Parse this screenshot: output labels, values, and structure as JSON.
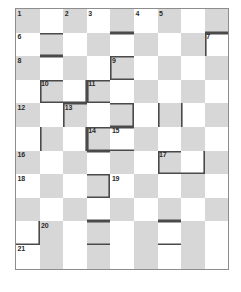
{
  "puzzle": {
    "kind": "crossword-grid",
    "columns": 9,
    "rows": 11,
    "colors": {
      "shaded_cell": "#d7d7d7",
      "empty_cell": "#ffffff",
      "grid_border": "#8d8d8d",
      "accent_border": "#4a4a4a",
      "number_text": "#2b2b2b"
    },
    "clue_numbers": [
      {
        "n": "1",
        "row": 1,
        "col": 1
      },
      {
        "n": "2",
        "row": 1,
        "col": 3
      },
      {
        "n": "3",
        "row": 1,
        "col": 4
      },
      {
        "n": "4",
        "row": 1,
        "col": 6
      },
      {
        "n": "5",
        "row": 1,
        "col": 7
      },
      {
        "n": "6",
        "row": 2,
        "col": 1
      },
      {
        "n": "7",
        "row": 2,
        "col": 9
      },
      {
        "n": "8",
        "row": 3,
        "col": 1
      },
      {
        "n": "9",
        "row": 3,
        "col": 5
      },
      {
        "n": "10",
        "row": 4,
        "col": 2
      },
      {
        "n": "11",
        "row": 4,
        "col": 4
      },
      {
        "n": "12",
        "row": 5,
        "col": 1
      },
      {
        "n": "13",
        "row": 5,
        "col": 3
      },
      {
        "n": "14",
        "row": 6,
        "col": 4
      },
      {
        "n": "15",
        "row": 6,
        "col": 5
      },
      {
        "n": "16",
        "row": 7,
        "col": 1
      },
      {
        "n": "17",
        "row": 7,
        "col": 7
      },
      {
        "n": "18",
        "row": 8,
        "col": 1
      },
      {
        "n": "19",
        "row": 8,
        "col": 5
      },
      {
        "n": "20",
        "row": 10,
        "col": 2
      },
      {
        "n": "21",
        "row": 11,
        "col": 1
      }
    ],
    "cells": [
      [
        {
          "shaded": true,
          "num": "1",
          "edges": []
        },
        {
          "shaded": false,
          "num": "",
          "edges": []
        },
        {
          "shaded": true,
          "num": "2",
          "edges": []
        },
        {
          "shaded": false,
          "num": "3",
          "edges": []
        },
        {
          "shaded": true,
          "num": "",
          "edges": [
            "bb"
          ]
        },
        {
          "shaded": false,
          "num": "4",
          "edges": []
        },
        {
          "shaded": true,
          "num": "5",
          "edges": []
        },
        {
          "shaded": false,
          "num": "",
          "edges": []
        },
        {
          "shaded": true,
          "num": "",
          "edges": [
            "bb"
          ]
        }
      ],
      [
        {
          "shaded": false,
          "num": "6",
          "edges": []
        },
        {
          "shaded": true,
          "num": "",
          "edges": [
            "bt",
            "bb"
          ]
        },
        {
          "shaded": false,
          "num": "",
          "edges": []
        },
        {
          "shaded": true,
          "num": "",
          "edges": []
        },
        {
          "shaded": false,
          "num": "",
          "edges": [
            "bt"
          ]
        },
        {
          "shaded": true,
          "num": "",
          "edges": []
        },
        {
          "shaded": false,
          "num": "",
          "edges": []
        },
        {
          "shaded": true,
          "num": "",
          "edges": []
        },
        {
          "shaded": false,
          "num": "7",
          "edges": [
            "bt",
            "bl"
          ]
        }
      ],
      [
        {
          "shaded": true,
          "num": "8",
          "edges": []
        },
        {
          "shaded": false,
          "num": "",
          "edges": [
            "bt"
          ]
        },
        {
          "shaded": true,
          "num": "",
          "edges": []
        },
        {
          "shaded": false,
          "num": "",
          "edges": []
        },
        {
          "shaded": true,
          "num": "9",
          "edges": [
            "bt",
            "bl",
            "bb"
          ]
        },
        {
          "shaded": false,
          "num": "",
          "edges": []
        },
        {
          "shaded": true,
          "num": "",
          "edges": []
        },
        {
          "shaded": false,
          "num": "",
          "edges": []
        },
        {
          "shaded": true,
          "num": "",
          "edges": []
        }
      ],
      [
        {
          "shaded": false,
          "num": "",
          "edges": []
        },
        {
          "shaded": true,
          "num": "10",
          "edges": [
            "bt",
            "bl",
            "bb"
          ]
        },
        {
          "shaded": false,
          "num": "",
          "edges": [
            "bb",
            "br"
          ]
        },
        {
          "shaded": true,
          "num": "11",
          "edges": [
            "bt",
            "bl",
            "bb"
          ]
        },
        {
          "shaded": false,
          "num": "",
          "edges": []
        },
        {
          "shaded": true,
          "num": "",
          "edges": []
        },
        {
          "shaded": false,
          "num": "",
          "edges": []
        },
        {
          "shaded": true,
          "num": "",
          "edges": []
        },
        {
          "shaded": false,
          "num": "",
          "edges": []
        }
      ],
      [
        {
          "shaded": true,
          "num": "12",
          "edges": []
        },
        {
          "shaded": false,
          "num": "",
          "edges": []
        },
        {
          "shaded": true,
          "num": "13",
          "edges": [
            "bt",
            "bl"
          ]
        },
        {
          "shaded": false,
          "num": "",
          "edges": []
        },
        {
          "shaded": true,
          "num": "",
          "edges": [
            "bt",
            "bb",
            "br"
          ]
        },
        {
          "shaded": false,
          "num": "",
          "edges": []
        },
        {
          "shaded": true,
          "num": "",
          "edges": [
            "bl"
          ]
        },
        {
          "shaded": false,
          "num": "",
          "edges": [
            "bl"
          ]
        },
        {
          "shaded": true,
          "num": "",
          "edges": []
        }
      ],
      [
        {
          "shaded": false,
          "num": "",
          "edges": []
        },
        {
          "shaded": true,
          "num": "",
          "edges": [
            "bl"
          ]
        },
        {
          "shaded": false,
          "num": "",
          "edges": [
            "br"
          ]
        },
        {
          "shaded": true,
          "num": "14",
          "edges": [
            "bt",
            "bl",
            "bb"
          ]
        },
        {
          "shaded": false,
          "num": "15",
          "edges": [
            "bt",
            "bb"
          ]
        },
        {
          "shaded": true,
          "num": "",
          "edges": []
        },
        {
          "shaded": false,
          "num": "",
          "edges": []
        },
        {
          "shaded": true,
          "num": "",
          "edges": []
        },
        {
          "shaded": false,
          "num": "",
          "edges": []
        }
      ],
      [
        {
          "shaded": true,
          "num": "16",
          "edges": []
        },
        {
          "shaded": false,
          "num": "",
          "edges": []
        },
        {
          "shaded": true,
          "num": "",
          "edges": []
        },
        {
          "shaded": false,
          "num": "",
          "edges": [
            "bt"
          ]
        },
        {
          "shaded": true,
          "num": "",
          "edges": []
        },
        {
          "shaded": false,
          "num": "",
          "edges": []
        },
        {
          "shaded": true,
          "num": "17",
          "edges": [
            "bt",
            "bl",
            "bb"
          ]
        },
        {
          "shaded": false,
          "num": "",
          "edges": [
            "bb",
            "br"
          ]
        },
        {
          "shaded": true,
          "num": "",
          "edges": []
        }
      ],
      [
        {
          "shaded": false,
          "num": "18",
          "edges": []
        },
        {
          "shaded": true,
          "num": "",
          "edges": []
        },
        {
          "shaded": false,
          "num": "",
          "edges": []
        },
        {
          "shaded": true,
          "num": "",
          "edges": [
            "bt",
            "bb",
            "br"
          ]
        },
        {
          "shaded": false,
          "num": "19",
          "edges": []
        },
        {
          "shaded": true,
          "num": "",
          "edges": []
        },
        {
          "shaded": false,
          "num": "",
          "edges": []
        },
        {
          "shaded": true,
          "num": "",
          "edges": []
        },
        {
          "shaded": false,
          "num": "",
          "edges": []
        }
      ],
      [
        {
          "shaded": true,
          "num": "",
          "edges": []
        },
        {
          "shaded": false,
          "num": "",
          "edges": []
        },
        {
          "shaded": true,
          "num": "",
          "edges": []
        },
        {
          "shaded": false,
          "num": "",
          "edges": [
            "bb"
          ]
        },
        {
          "shaded": true,
          "num": "",
          "edges": []
        },
        {
          "shaded": false,
          "num": "",
          "edges": []
        },
        {
          "shaded": true,
          "num": "",
          "edges": [
            "bb"
          ]
        },
        {
          "shaded": false,
          "num": "",
          "edges": []
        },
        {
          "shaded": true,
          "num": "",
          "edges": []
        }
      ],
      [
        {
          "shaded": false,
          "num": "",
          "edges": [
            "bb",
            "br"
          ]
        },
        {
          "shaded": true,
          "num": "20",
          "edges": []
        },
        {
          "shaded": false,
          "num": "",
          "edges": []
        },
        {
          "shaded": true,
          "num": "",
          "edges": [
            "bt",
            "bb"
          ]
        },
        {
          "shaded": false,
          "num": "",
          "edges": []
        },
        {
          "shaded": true,
          "num": "",
          "edges": []
        },
        {
          "shaded": false,
          "num": "",
          "edges": [
            "bt",
            "bb"
          ]
        },
        {
          "shaded": true,
          "num": "",
          "edges": []
        },
        {
          "shaded": false,
          "num": "",
          "edges": []
        }
      ],
      [
        {
          "shaded": false,
          "num": "21",
          "edges": []
        },
        {
          "shaded": true,
          "num": "",
          "edges": []
        },
        {
          "shaded": false,
          "num": "",
          "edges": []
        },
        {
          "shaded": true,
          "num": "",
          "edges": []
        },
        {
          "shaded": false,
          "num": "",
          "edges": []
        },
        {
          "shaded": true,
          "num": "",
          "edges": []
        },
        {
          "shaded": false,
          "num": "",
          "edges": []
        },
        {
          "shaded": true,
          "num": "",
          "edges": []
        },
        {
          "shaded": false,
          "num": "",
          "edges": []
        }
      ]
    ]
  }
}
